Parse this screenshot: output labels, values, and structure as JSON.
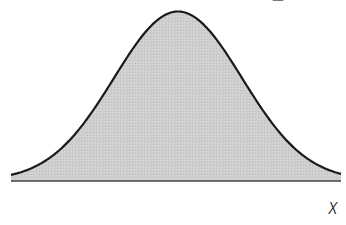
{
  "chart_data": {
    "type": "area",
    "title": "",
    "xlabel": "X",
    "ylabel": "",
    "x_ticks": [],
    "y_ticks": [],
    "grid": false,
    "legend": null,
    "distribution": {
      "kind": "normal",
      "mean_px": 178,
      "sigma_px": 64
    },
    "fill_color": "#cccccc",
    "line_color": "#1a1a1a",
    "axis_color": "#444444"
  },
  "labels": {
    "x_axis": "X"
  }
}
